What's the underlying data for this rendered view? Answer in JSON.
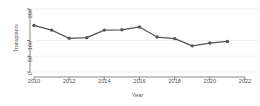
{
  "chart_data": {
    "type": "line",
    "title": "",
    "xlabel": "Year",
    "ylabel": "Transplants",
    "x": [
      2010,
      2011,
      2012,
      2013,
      2014,
      2015,
      2016,
      2017,
      2018,
      2019,
      2020,
      2021
    ],
    "values": [
      148,
      133,
      107,
      109,
      133,
      134,
      143,
      111,
      106,
      83,
      92,
      97
    ],
    "series": [
      {
        "name": "Transplants",
        "values": [
          148,
          133,
          107,
          109,
          133,
          134,
          143,
          111,
          106,
          83,
          92,
          97
        ]
      }
    ],
    "xlim": [
      2010,
      2022
    ],
    "ylim": [
      0,
      200
    ],
    "xticks": [
      2010,
      2012,
      2014,
      2016,
      2018,
      2020,
      2022
    ],
    "xtick_labels": [
      "2010",
      "2012",
      "2014",
      "2016",
      "2018",
      "2020",
      "2022"
    ],
    "yticks": [
      0,
      50,
      100,
      200
    ],
    "ytick_labels": [
      "0",
      "50",
      "100",
      "200"
    ],
    "grid": true,
    "grid_color": "#e8e8e8",
    "legend": false,
    "legend_position": "none",
    "line_color": "#555555",
    "marker": "circle",
    "marker_color": "#555555",
    "background": "#ffffff",
    "axis_color": "#555555"
  }
}
